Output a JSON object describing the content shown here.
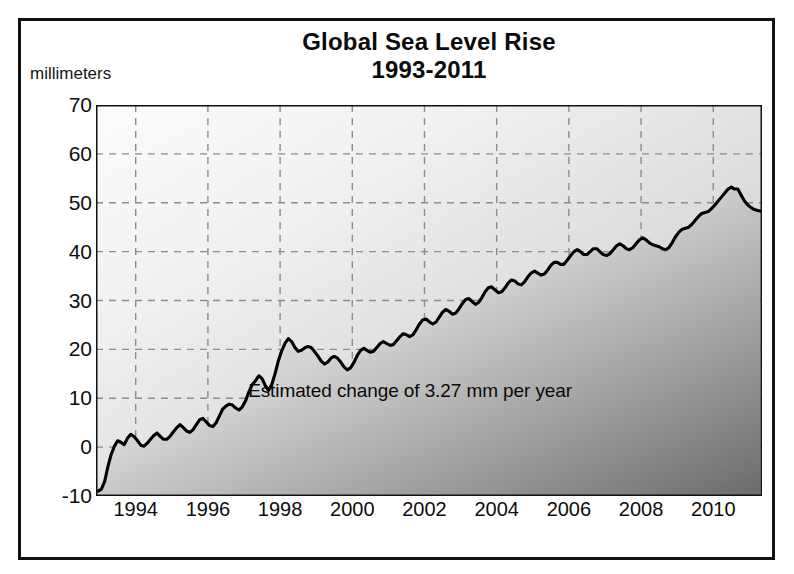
{
  "figure": {
    "title_line1": "Global Sea Level Rise",
    "title_line2": "1993-2011",
    "ylabel": "millimeters",
    "xlabel": "Year",
    "annotation": "Estimated change of 3.27 mm per year",
    "line_color": "#000000",
    "fill_light": "#f2f2f2",
    "fill_dark": "#6e6e6e",
    "grid_color": "#8c8c8c",
    "frame_color": "#111111"
  },
  "chart_data": {
    "type": "area",
    "title": "Global Sea Level Rise 1993-2011",
    "subtitle": "1993-2011",
    "xlabel": "Year",
    "ylabel": "millimeters",
    "xlim": [
      1992.9,
      2011.35
    ],
    "ylim": [
      -10,
      70
    ],
    "yticks": [
      -10,
      0,
      10,
      20,
      30,
      40,
      50,
      60,
      70
    ],
    "xticks": [
      1994,
      1996,
      1998,
      2000,
      2002,
      2004,
      2006,
      2008,
      2010
    ],
    "grid": true,
    "grid_style": "dashed",
    "legend": "none",
    "annotations": [
      {
        "text": "Estimated change of 3.27 mm per year",
        "x": 2001.6,
        "y": 11.5
      }
    ],
    "series": [
      {
        "name": "Global mean sea level anomaly",
        "units": "mm",
        "x": [
          1992.96,
          1993.05,
          1993.14,
          1993.23,
          1993.32,
          1993.41,
          1993.5,
          1993.59,
          1993.68,
          1993.77,
          1993.86,
          1993.95,
          1994.04,
          1994.14,
          1994.23,
          1994.32,
          1994.41,
          1994.5,
          1994.59,
          1994.68,
          1994.77,
          1994.86,
          1994.95,
          1995.05,
          1995.14,
          1995.23,
          1995.32,
          1995.41,
          1995.5,
          1995.59,
          1995.68,
          1995.77,
          1995.86,
          1995.95,
          1996.05,
          1996.14,
          1996.23,
          1996.32,
          1996.41,
          1996.5,
          1996.59,
          1996.68,
          1996.77,
          1996.86,
          1996.95,
          1997.05,
          1997.14,
          1997.23,
          1997.32,
          1997.41,
          1997.5,
          1997.59,
          1997.68,
          1997.77,
          1997.86,
          1997.95,
          1998.05,
          1998.14,
          1998.23,
          1998.32,
          1998.41,
          1998.5,
          1998.59,
          1998.68,
          1998.77,
          1998.86,
          1998.95,
          1999.05,
          1999.14,
          1999.23,
          1999.32,
          1999.41,
          1999.5,
          1999.59,
          1999.68,
          1999.77,
          1999.86,
          1999.95,
          2000.05,
          2000.14,
          2000.23,
          2000.32,
          2000.41,
          2000.5,
          2000.59,
          2000.68,
          2000.77,
          2000.86,
          2000.95,
          2001.05,
          2001.14,
          2001.23,
          2001.32,
          2001.41,
          2001.5,
          2001.59,
          2001.68,
          2001.77,
          2001.86,
          2001.95,
          2002.05,
          2002.14,
          2002.23,
          2002.32,
          2002.41,
          2002.5,
          2002.59,
          2002.68,
          2002.77,
          2002.86,
          2002.95,
          2003.05,
          2003.14,
          2003.23,
          2003.32,
          2003.41,
          2003.5,
          2003.59,
          2003.68,
          2003.77,
          2003.86,
          2003.95,
          2004.05,
          2004.14,
          2004.23,
          2004.32,
          2004.41,
          2004.5,
          2004.59,
          2004.68,
          2004.77,
          2004.86,
          2004.95,
          2005.05,
          2005.14,
          2005.23,
          2005.32,
          2005.41,
          2005.5,
          2005.59,
          2005.68,
          2005.77,
          2005.86,
          2005.95,
          2006.05,
          2006.14,
          2006.23,
          2006.32,
          2006.41,
          2006.5,
          2006.59,
          2006.68,
          2006.77,
          2006.86,
          2006.95,
          2007.05,
          2007.14,
          2007.23,
          2007.32,
          2007.41,
          2007.5,
          2007.59,
          2007.68,
          2007.77,
          2007.86,
          2007.95,
          2008.05,
          2008.14,
          2008.23,
          2008.32,
          2008.41,
          2008.5,
          2008.59,
          2008.68,
          2008.77,
          2008.86,
          2008.95,
          2009.05,
          2009.14,
          2009.23,
          2009.32,
          2009.41,
          2009.5,
          2009.59,
          2009.68,
          2009.77,
          2009.86,
          2009.95,
          2010.05,
          2010.14,
          2010.23,
          2010.32,
          2010.41,
          2010.5,
          2010.59,
          2010.68,
          2010.77,
          2010.86,
          2010.95,
          2011.05,
          2011.14,
          2011.23,
          2011.3
        ],
        "y": [
          -9.0,
          -8.6,
          -7.0,
          -4.0,
          -1.5,
          0.2,
          1.3,
          1.0,
          0.5,
          1.8,
          2.6,
          2.2,
          1.4,
          0.4,
          0.2,
          0.8,
          1.6,
          2.4,
          2.9,
          2.2,
          1.6,
          1.6,
          2.2,
          3.2,
          4.0,
          4.6,
          4.0,
          3.3,
          3.0,
          3.6,
          4.6,
          5.6,
          5.9,
          5.2,
          4.4,
          4.2,
          5.0,
          6.4,
          7.8,
          8.4,
          8.8,
          8.6,
          8.0,
          7.6,
          8.2,
          9.6,
          11.4,
          12.8,
          13.6,
          14.6,
          14.0,
          12.6,
          11.6,
          12.8,
          15.0,
          17.6,
          19.8,
          21.3,
          22.2,
          21.6,
          20.4,
          19.6,
          19.8,
          20.3,
          20.6,
          20.4,
          19.6,
          18.6,
          17.6,
          17.0,
          17.4,
          18.2,
          18.6,
          18.2,
          17.4,
          16.4,
          15.8,
          16.2,
          17.4,
          18.8,
          19.8,
          20.2,
          19.8,
          19.4,
          19.6,
          20.4,
          21.2,
          21.6,
          21.2,
          20.8,
          21.0,
          21.8,
          22.6,
          23.2,
          23.0,
          22.6,
          23.0,
          24.0,
          25.2,
          26.0,
          26.2,
          25.6,
          25.2,
          25.6,
          26.6,
          27.6,
          28.2,
          27.8,
          27.2,
          27.4,
          28.2,
          29.4,
          30.2,
          30.4,
          29.8,
          29.2,
          29.6,
          30.6,
          31.8,
          32.6,
          32.8,
          32.2,
          31.6,
          31.8,
          32.6,
          33.6,
          34.2,
          34.0,
          33.4,
          33.2,
          33.8,
          34.8,
          35.6,
          36.0,
          35.6,
          35.2,
          35.4,
          36.2,
          37.2,
          37.8,
          37.8,
          37.4,
          37.4,
          38.2,
          39.2,
          40.0,
          40.4,
          40.0,
          39.4,
          39.4,
          40.0,
          40.6,
          40.6,
          40.0,
          39.4,
          39.2,
          39.6,
          40.4,
          41.2,
          41.6,
          41.2,
          40.6,
          40.4,
          40.8,
          41.6,
          42.4,
          42.8,
          42.4,
          41.8,
          41.4,
          41.2,
          41.0,
          40.6,
          40.4,
          40.8,
          41.8,
          43.0,
          44.0,
          44.6,
          44.8,
          45.0,
          45.6,
          46.4,
          47.2,
          47.8,
          48.0,
          48.2,
          48.8,
          49.6,
          50.4,
          51.2,
          52.0,
          52.8,
          53.2,
          52.8,
          52.8,
          51.6,
          50.4,
          49.6,
          49.0,
          48.6,
          48.4,
          48.3
        ]
      }
    ]
  }
}
